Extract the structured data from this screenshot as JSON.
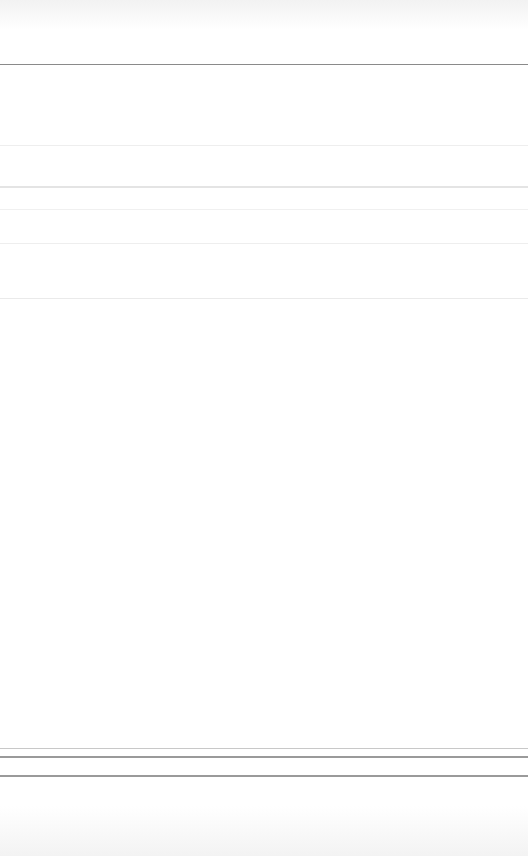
{
  "page": {
    "state": "blank",
    "background": "#ffffff"
  },
  "dividers": [
    {
      "y": 64,
      "color": "#8a8a8a",
      "thickness": 1
    },
    {
      "y": 145,
      "color": "#eeeeee",
      "thickness": 1
    },
    {
      "y": 186,
      "color": "#e4e4e4",
      "thickness": 2
    },
    {
      "y": 209,
      "color": "#f0f0f0",
      "thickness": 1
    },
    {
      "y": 243,
      "color": "#eeeeee",
      "thickness": 1
    },
    {
      "y": 298,
      "color": "#eaeaea",
      "thickness": 1
    },
    {
      "y": 748,
      "color": "#c8c8c8",
      "thickness": 1
    },
    {
      "y": 756,
      "color": "#9a9a9a",
      "thickness": 2
    },
    {
      "y": 775,
      "color": "#9a9a9a",
      "thickness": 2
    }
  ]
}
